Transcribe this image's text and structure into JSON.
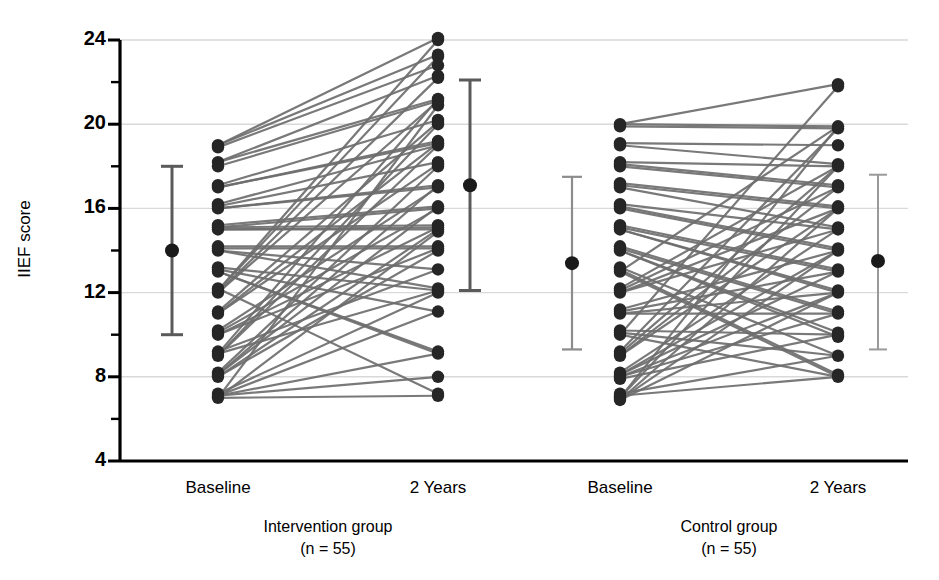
{
  "chart_data": {
    "type": "line",
    "title": "",
    "subtitle": "",
    "xlabel": "",
    "ylabel": "IIEF score",
    "ylim": [
      4,
      24
    ],
    "yticks": [
      4,
      8,
      12,
      16,
      20,
      24
    ],
    "ytick_labels": [
      "4",
      "8",
      "12",
      "16",
      "20",
      "24"
    ],
    "yminor_ticks": [
      6,
      10,
      14,
      18,
      22
    ],
    "grid": "horizontal-major-only",
    "legend": "none",
    "x_categories": [
      "Baseline",
      "2 Years",
      "Baseline",
      "2 Years"
    ],
    "group_labels": [
      {
        "name": "Intervention group",
        "n": "(n = 55)"
      },
      {
        "name": "Control group",
        "n": "(n = 55)"
      }
    ],
    "series": [
      {
        "name": "Intervention group",
        "n": 55,
        "x": [
          "Baseline",
          "2 Years"
        ],
        "pairs": [
          [
            19.0,
            24.1
          ],
          [
            19.0,
            23.3
          ],
          [
            18.9,
            22.8
          ],
          [
            18.2,
            22.3
          ],
          [
            18.2,
            21.2
          ],
          [
            18.0,
            21.1
          ],
          [
            17.1,
            20.2
          ],
          [
            17.0,
            19.2
          ],
          [
            17.0,
            19.1
          ],
          [
            16.2,
            19.0
          ],
          [
            16.1,
            18.2
          ],
          [
            16.0,
            17.1
          ],
          [
            16.0,
            17.0
          ],
          [
            15.2,
            16.1
          ],
          [
            15.1,
            16.0
          ],
          [
            15.1,
            15.2
          ],
          [
            15.0,
            15.1
          ],
          [
            15.0,
            15.0
          ],
          [
            14.2,
            14.2
          ],
          [
            14.1,
            14.1
          ],
          [
            14.0,
            13.1
          ],
          [
            14.0,
            12.2
          ],
          [
            13.2,
            12.1
          ],
          [
            13.1,
            11.1
          ],
          [
            13.0,
            9.2
          ],
          [
            13.0,
            9.1
          ],
          [
            12.2,
            7.2
          ],
          [
            12.1,
            24.0
          ],
          [
            12.1,
            23.2
          ],
          [
            12.0,
            22.2
          ],
          [
            12.0,
            21.1
          ],
          [
            11.1,
            20.1
          ],
          [
            11.0,
            19.1
          ],
          [
            11.0,
            18.1
          ],
          [
            10.2,
            17.0
          ],
          [
            10.1,
            16.0
          ],
          [
            10.0,
            15.1
          ],
          [
            10.0,
            14.1
          ],
          [
            9.2,
            13.1
          ],
          [
            9.1,
            12.1
          ],
          [
            9.1,
            21.2
          ],
          [
            9.0,
            20.0
          ],
          [
            9.0,
            19.0
          ],
          [
            8.2,
            18.0
          ],
          [
            8.1,
            17.1
          ],
          [
            8.1,
            16.1
          ],
          [
            8.0,
            15.0
          ],
          [
            8.0,
            14.0
          ],
          [
            7.2,
            12.0
          ],
          [
            7.1,
            11.1
          ],
          [
            7.1,
            9.1
          ],
          [
            7.1,
            8.0
          ],
          [
            7.0,
            7.1
          ],
          [
            7.0,
            14.9
          ],
          [
            7.0,
            20.9
          ]
        ],
        "baseline_mean": 14.0,
        "baseline_error_low": 10.0,
        "baseline_error_high": 18.0,
        "followup_mean": 17.1,
        "followup_error_low": 12.1,
        "followup_error_high": 22.1
      },
      {
        "name": "Control group",
        "n": 55,
        "x": [
          "Baseline",
          "2 Years"
        ],
        "pairs": [
          [
            20.0,
            21.9
          ],
          [
            20.0,
            19.9
          ],
          [
            19.9,
            19.8
          ],
          [
            19.1,
            19.0
          ],
          [
            19.0,
            18.1
          ],
          [
            18.2,
            18.0
          ],
          [
            18.1,
            17.1
          ],
          [
            18.0,
            17.0
          ],
          [
            17.2,
            16.1
          ],
          [
            17.1,
            16.0
          ],
          [
            17.0,
            15.1
          ],
          [
            16.2,
            15.0
          ],
          [
            16.1,
            14.1
          ],
          [
            16.0,
            14.0
          ],
          [
            15.2,
            13.1
          ],
          [
            15.1,
            13.0
          ],
          [
            15.0,
            12.1
          ],
          [
            15.0,
            12.0
          ],
          [
            14.2,
            11.1
          ],
          [
            14.1,
            11.0
          ],
          [
            14.0,
            10.1
          ],
          [
            14.0,
            9.9
          ],
          [
            13.2,
            9.0
          ],
          [
            13.1,
            8.1
          ],
          [
            13.0,
            8.0
          ],
          [
            13.0,
            19.9
          ],
          [
            12.2,
            18.0
          ],
          [
            12.1,
            17.0
          ],
          [
            12.0,
            16.0
          ],
          [
            12.0,
            15.0
          ],
          [
            11.2,
            14.0
          ],
          [
            11.1,
            13.0
          ],
          [
            11.0,
            12.0
          ],
          [
            11.0,
            11.0
          ],
          [
            10.2,
            10.0
          ],
          [
            10.1,
            9.0
          ],
          [
            10.0,
            8.0
          ],
          [
            10.0,
            21.8
          ],
          [
            9.2,
            19.8
          ],
          [
            9.1,
            18.0
          ],
          [
            9.0,
            17.0
          ],
          [
            9.0,
            16.0
          ],
          [
            8.2,
            15.0
          ],
          [
            8.1,
            14.0
          ],
          [
            8.1,
            13.0
          ],
          [
            8.0,
            12.0
          ],
          [
            8.0,
            11.0
          ],
          [
            7.9,
            10.0
          ],
          [
            7.2,
            9.0
          ],
          [
            7.1,
            8.0
          ],
          [
            7.0,
            19.9
          ],
          [
            7.0,
            18.0
          ],
          [
            6.9,
            16.0
          ],
          [
            6.9,
            14.0
          ],
          [
            6.9,
            12.0
          ]
        ],
        "baseline_mean": 13.4,
        "baseline_error_low": 9.3,
        "baseline_error_high": 17.5,
        "followup_mean": 13.5,
        "followup_error_low": 9.3,
        "followup_error_high": 17.6
      }
    ],
    "colors": {
      "line": "#6e6e6e",
      "point": "#262626",
      "error_bar_intervention_baseline": "#5a5a5a",
      "error_bar_intervention_followup": "#5a5a5a",
      "error_bar_control_baseline": "#8c8c8c",
      "error_bar_control_followup": "#9a9a9a",
      "axis": "#000000",
      "grid": "#d9d9d9",
      "background": "#ffffff"
    }
  }
}
